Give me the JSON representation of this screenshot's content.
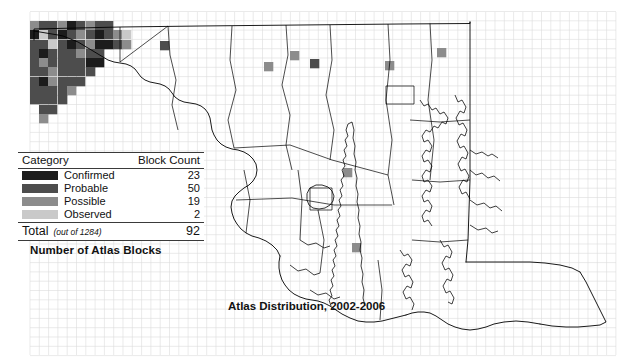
{
  "figure": {
    "title": "Atlas Distribution, 2002-2006",
    "caption": "Number of Atlas Blocks",
    "background_color": "#ffffff",
    "outline_color": "#000000",
    "grid_color": "#d9d9d9"
  },
  "legend": {
    "header": {
      "category_label": "Category",
      "count_label": "Block Count"
    },
    "rows": [
      {
        "label": "Confirmed",
        "count": "23",
        "color": "#1c1c1c"
      },
      {
        "label": "Probable",
        "count": "50",
        "color": "#4d4d4d"
      },
      {
        "label": "Possible",
        "count": "19",
        "color": "#8c8c8c"
      },
      {
        "label": "Observed",
        "count": "2",
        "color": "#c9c9c9"
      }
    ],
    "total": {
      "label": "Total",
      "note": "(out of 1284)",
      "count": "92"
    }
  },
  "chart_data": {
    "type": "map",
    "title": "Atlas Distribution, 2002-2006",
    "subtitle": "Number of Atlas Blocks",
    "region": "Maryland",
    "grid_cell_size_px": 9.3,
    "categories": [
      "Confirmed",
      "Probable",
      "Possible",
      "Observed"
    ],
    "values": [
      23,
      50,
      19,
      2
    ],
    "total": 92,
    "total_blocks": 1284,
    "colors": [
      "#1c1c1c",
      "#4d4d4d",
      "#8c8c8c",
      "#c9c9c9"
    ],
    "blocks": [
      {
        "x": 30,
        "y": 21,
        "cat": 2
      },
      {
        "x": 39,
        "y": 21,
        "cat": 1
      },
      {
        "x": 48,
        "y": 21,
        "cat": 1
      },
      {
        "x": 58,
        "y": 21,
        "cat": 2
      },
      {
        "x": 67,
        "y": 21,
        "cat": 0
      },
      {
        "x": 76,
        "y": 21,
        "cat": 1
      },
      {
        "x": 86,
        "y": 21,
        "cat": 2
      },
      {
        "x": 95,
        "y": 21,
        "cat": 1
      },
      {
        "x": 104,
        "y": 21,
        "cat": 1
      },
      {
        "x": 30,
        "y": 30,
        "cat": 0
      },
      {
        "x": 39,
        "y": 30,
        "cat": 3
      },
      {
        "x": 48,
        "y": 30,
        "cat": 1
      },
      {
        "x": 58,
        "y": 30,
        "cat": 0
      },
      {
        "x": 67,
        "y": 30,
        "cat": 1
      },
      {
        "x": 76,
        "y": 30,
        "cat": 2
      },
      {
        "x": 86,
        "y": 30,
        "cat": 1
      },
      {
        "x": 95,
        "y": 30,
        "cat": 0
      },
      {
        "x": 104,
        "y": 30,
        "cat": 1
      },
      {
        "x": 113,
        "y": 30,
        "cat": 2
      },
      {
        "x": 30,
        "y": 40,
        "cat": 1
      },
      {
        "x": 39,
        "y": 40,
        "cat": 1
      },
      {
        "x": 48,
        "y": 40,
        "cat": 3
      },
      {
        "x": 58,
        "y": 40,
        "cat": 1
      },
      {
        "x": 67,
        "y": 40,
        "cat": 0
      },
      {
        "x": 76,
        "y": 40,
        "cat": 1
      },
      {
        "x": 86,
        "y": 40,
        "cat": 2
      },
      {
        "x": 95,
        "y": 40,
        "cat": 0
      },
      {
        "x": 104,
        "y": 40,
        "cat": 0
      },
      {
        "x": 30,
        "y": 49,
        "cat": 1
      },
      {
        "x": 39,
        "y": 49,
        "cat": 0
      },
      {
        "x": 48,
        "y": 49,
        "cat": 1
      },
      {
        "x": 58,
        "y": 49,
        "cat": 1
      },
      {
        "x": 67,
        "y": 49,
        "cat": 1
      },
      {
        "x": 76,
        "y": 49,
        "cat": 2
      },
      {
        "x": 86,
        "y": 49,
        "cat": 1
      },
      {
        "x": 95,
        "y": 49,
        "cat": 1
      },
      {
        "x": 30,
        "y": 58,
        "cat": 1
      },
      {
        "x": 39,
        "y": 58,
        "cat": 2
      },
      {
        "x": 48,
        "y": 58,
        "cat": 1
      },
      {
        "x": 58,
        "y": 58,
        "cat": 1
      },
      {
        "x": 67,
        "y": 58,
        "cat": 1
      },
      {
        "x": 76,
        "y": 58,
        "cat": 1
      },
      {
        "x": 86,
        "y": 58,
        "cat": 0
      },
      {
        "x": 95,
        "y": 58,
        "cat": 0
      },
      {
        "x": 30,
        "y": 67,
        "cat": 1
      },
      {
        "x": 39,
        "y": 67,
        "cat": 1
      },
      {
        "x": 48,
        "y": 67,
        "cat": 2
      },
      {
        "x": 58,
        "y": 67,
        "cat": 1
      },
      {
        "x": 67,
        "y": 67,
        "cat": 1
      },
      {
        "x": 76,
        "y": 67,
        "cat": 1
      },
      {
        "x": 86,
        "y": 67,
        "cat": 1
      },
      {
        "x": 30,
        "y": 77,
        "cat": 1
      },
      {
        "x": 39,
        "y": 77,
        "cat": 0
      },
      {
        "x": 48,
        "y": 77,
        "cat": 2
      },
      {
        "x": 58,
        "y": 77,
        "cat": 1
      },
      {
        "x": 67,
        "y": 77,
        "cat": 1
      },
      {
        "x": 76,
        "y": 77,
        "cat": 1
      },
      {
        "x": 30,
        "y": 86,
        "cat": 1
      },
      {
        "x": 39,
        "y": 86,
        "cat": 1
      },
      {
        "x": 48,
        "y": 86,
        "cat": 1
      },
      {
        "x": 58,
        "y": 86,
        "cat": 1
      },
      {
        "x": 67,
        "y": 86,
        "cat": 2
      },
      {
        "x": 30,
        "y": 95,
        "cat": 1
      },
      {
        "x": 39,
        "y": 95,
        "cat": 1
      },
      {
        "x": 48,
        "y": 95,
        "cat": 1
      },
      {
        "x": 58,
        "y": 95,
        "cat": 1
      },
      {
        "x": 39,
        "y": 105,
        "cat": 1
      },
      {
        "x": 48,
        "y": 105,
        "cat": 1
      },
      {
        "x": 39,
        "y": 114,
        "cat": 2
      },
      {
        "x": 113,
        "y": 40,
        "cat": 1
      },
      {
        "x": 122,
        "y": 40,
        "cat": 2
      },
      {
        "x": 122,
        "y": 30,
        "cat": 3
      },
      {
        "x": 160,
        "y": 41,
        "cat": 1
      },
      {
        "x": 264,
        "y": 62,
        "cat": 2
      },
      {
        "x": 290,
        "y": 51,
        "cat": 2
      },
      {
        "x": 310,
        "y": 59,
        "cat": 1
      },
      {
        "x": 385,
        "y": 61,
        "cat": 2
      },
      {
        "x": 437,
        "y": 48,
        "cat": 2
      },
      {
        "x": 343,
        "y": 168,
        "cat": 2
      },
      {
        "x": 352,
        "y": 243,
        "cat": 2
      }
    ]
  }
}
